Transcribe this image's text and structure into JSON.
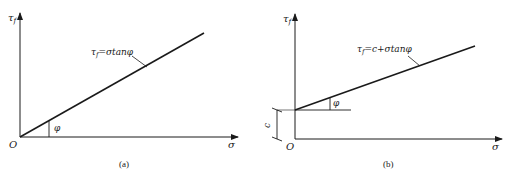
{
  "colors": {
    "ink": "#1a1a1a",
    "background": "#ffffff"
  },
  "panels": [
    {
      "id": "a",
      "caption": "(a)",
      "y_axis_label": "τ",
      "y_axis_subscript": "f",
      "x_axis_label": "σ",
      "origin_label": "O",
      "angle_label": "φ",
      "equation_lhs": "τ",
      "equation_sub": "f",
      "equation_rhs": "=σtanφ"
    },
    {
      "id": "b",
      "caption": "(b)",
      "y_axis_label": "τ",
      "y_axis_subscript": "f",
      "x_axis_label": "σ",
      "origin_label": "O",
      "angle_label": "φ",
      "intercept_label": "c",
      "equation_lhs": "τ",
      "equation_sub": "f",
      "equation_rhs": "=c+σtanφ"
    }
  ]
}
